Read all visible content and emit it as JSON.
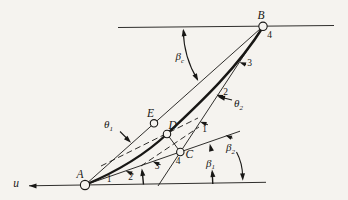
{
  "figure": {
    "axis_label": "u",
    "points": {
      "A": "A",
      "B": "B",
      "C": "C",
      "D": "D",
      "E": "E"
    },
    "lower_position_labels": [
      "1",
      "2",
      "3",
      "4"
    ],
    "upper_position_labels": [
      "1",
      "2",
      "3",
      "4"
    ],
    "angles": {
      "theta1": {
        "symbol": "θ",
        "sub": "1"
      },
      "theta2": {
        "symbol": "θ",
        "sub": "2"
      },
      "beta1": {
        "symbol": "β",
        "sub": "1"
      },
      "beta2": {
        "symbol": "β",
        "sub": "2"
      },
      "betac": {
        "symbol": "β",
        "sub": "c"
      }
    },
    "colors": {
      "ink": "#181715",
      "paper": "#f5f3ef"
    }
  }
}
